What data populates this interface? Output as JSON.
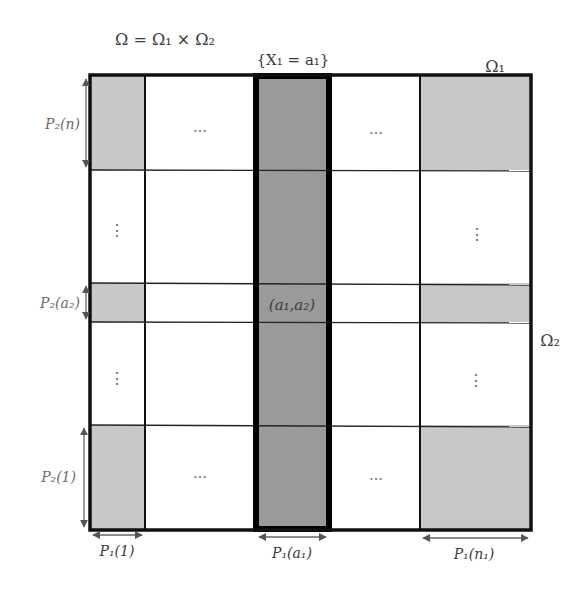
{
  "diagram": {
    "title": "Ω = Ω₁ × Ω₂",
    "event_label": "{X₁ = a₁}",
    "axis_labels": {
      "omega1": "Ω₁",
      "omega2": "Ω₂"
    },
    "cell_label": "(a₁,a₂)",
    "row_labels": [
      {
        "id": "p2n",
        "text": "P₂(n)"
      },
      {
        "id": "p2a2",
        "text": "P₂(a₂)"
      },
      {
        "id": "p21",
        "text": "P₂(1)"
      }
    ],
    "col_labels": [
      {
        "id": "p11",
        "text": "P₁(1)"
      },
      {
        "id": "p1a1",
        "text": "P₁(a₁)"
      },
      {
        "id": "p1n1",
        "text": "P₁(n₁)"
      }
    ],
    "ellipsis_h": "⋯",
    "ellipsis_v": "⋮",
    "colors": {
      "light_gray": "#c8c8c8",
      "dark_gray": "#9a9a9a",
      "border": "#111111",
      "arrow": "#666666"
    }
  }
}
